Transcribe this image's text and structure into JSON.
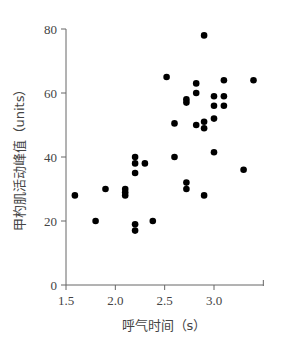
{
  "chart_data": {
    "type": "scatter",
    "title": "",
    "xlabel": "呼气时间（s）",
    "ylabel": "甲杓肌活动峰值（units）",
    "xlim": [
      1.5,
      3.5
    ],
    "ylim": [
      0,
      80
    ],
    "xticks": [
      1.5,
      2.0,
      2.5,
      3.0
    ],
    "xtick_labels": [
      "1.5",
      "2.0",
      "2.5",
      "3.0"
    ],
    "yticks": [
      0,
      20,
      40,
      60,
      80
    ],
    "ytick_labels": [
      "0",
      "20",
      "40",
      "60",
      "80"
    ],
    "grid": false,
    "legend": null,
    "marker_color": "#000000",
    "series": [
      {
        "name": "data",
        "points": [
          [
            1.59,
            28
          ],
          [
            1.8,
            20
          ],
          [
            1.9,
            30
          ],
          [
            2.1,
            30
          ],
          [
            2.1,
            29
          ],
          [
            2.1,
            28
          ],
          [
            2.2,
            19
          ],
          [
            2.2,
            17
          ],
          [
            2.2,
            40
          ],
          [
            2.2,
            38
          ],
          [
            2.2,
            35
          ],
          [
            2.3,
            38
          ],
          [
            2.38,
            20
          ],
          [
            2.52,
            65
          ],
          [
            2.6,
            50.5
          ],
          [
            2.6,
            40
          ],
          [
            2.72,
            58
          ],
          [
            2.72,
            57
          ],
          [
            2.72,
            32
          ],
          [
            2.72,
            30
          ],
          [
            2.82,
            63
          ],
          [
            2.82,
            60
          ],
          [
            2.82,
            50
          ],
          [
            2.9,
            78
          ],
          [
            2.9,
            51
          ],
          [
            2.9,
            49
          ],
          [
            2.9,
            28
          ],
          [
            3.0,
            59
          ],
          [
            3.0,
            56
          ],
          [
            3.0,
            52
          ],
          [
            3.0,
            41.5
          ],
          [
            3.1,
            64
          ],
          [
            3.1,
            59
          ],
          [
            3.1,
            56
          ],
          [
            3.3,
            36
          ],
          [
            3.4,
            64
          ]
        ]
      }
    ]
  }
}
